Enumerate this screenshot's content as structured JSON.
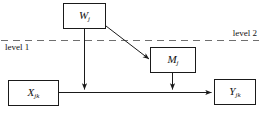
{
  "diagram": {
    "type": "multilevel-mediation-path-diagram",
    "nodes": [
      {
        "id": "w",
        "base": "W",
        "subscript": "j",
        "name": "node-w"
      },
      {
        "id": "m",
        "base": "M",
        "subscript": "j",
        "name": "node-m"
      },
      {
        "id": "x",
        "base": "X",
        "subscript": "jk",
        "name": "node-x"
      },
      {
        "id": "y",
        "base": "Y",
        "subscript": "jk",
        "name": "node-y"
      }
    ],
    "level_labels": {
      "upper": "level 2",
      "lower": "level 1"
    },
    "divider": {
      "style": "dashed",
      "orientation": "horizontal"
    },
    "edges": [
      {
        "from": "w",
        "to": "m",
        "style": "solid",
        "arrow": true
      },
      {
        "from": "w",
        "to": "x-y-path",
        "style": "solid",
        "arrow": true
      },
      {
        "from": "m",
        "to": "x-y-path",
        "style": "solid",
        "arrow": true
      },
      {
        "from": "x",
        "to": "y",
        "style": "solid",
        "arrow": true
      }
    ],
    "colors": {
      "stroke": "#1a1a1a",
      "divider": "#6f6f6f",
      "background": "#ffffff"
    }
  }
}
